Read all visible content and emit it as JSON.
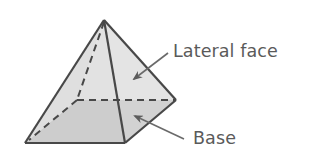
{
  "diagram": {
    "labels": {
      "lateral_face": "Lateral face",
      "base": "Base"
    },
    "colors": {
      "lateral_face_fill": "#e2e2e2",
      "side_face_fill": "#d6d6d6",
      "base_fill": "#bdbdbd",
      "edge_stroke": "#484848",
      "arrow_stroke": "#6a6a6a",
      "text": "#5a5a5a",
      "background": "#ffffff"
    },
    "vertices": {
      "apex": [
        104,
        20
      ],
      "front_left": [
        25,
        143
      ],
      "front_right": [
        125,
        143
      ],
      "back_right": [
        176,
        100
      ],
      "back_left": [
        77,
        100
      ]
    }
  }
}
